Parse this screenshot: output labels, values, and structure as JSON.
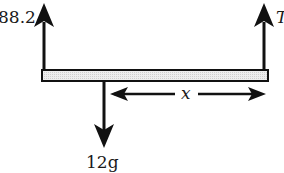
{
  "diagram": {
    "type": "free-body-diagram",
    "beam": {
      "fill": "#e8e8e8",
      "stroke": "#111111"
    },
    "forces": [
      {
        "id": "left-up",
        "label": "88.2",
        "direction": "up",
        "position": "left end"
      },
      {
        "id": "right-up",
        "label": "T",
        "direction": "up",
        "position": "right end"
      },
      {
        "id": "down",
        "label": "12g",
        "direction": "down",
        "position": "between ends"
      }
    ],
    "dimension": {
      "label": "x",
      "from": "downward force",
      "to": "right end"
    },
    "colors": {
      "ink": "#111111",
      "background": "#ffffff"
    }
  }
}
